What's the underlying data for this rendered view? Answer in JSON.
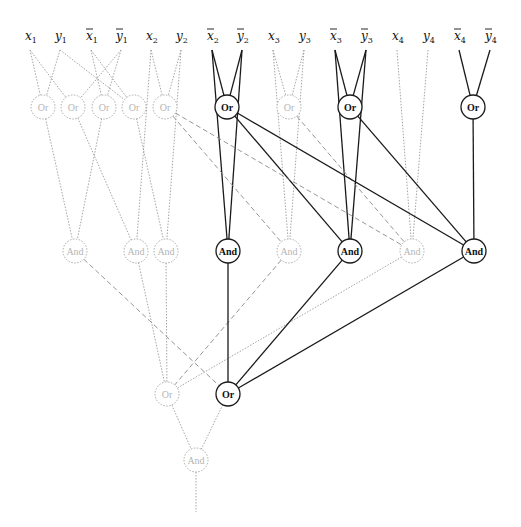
{
  "diagram": {
    "inputs": [
      {
        "id": "x1",
        "base": "x",
        "sub": "1",
        "neg": false,
        "x": 30,
        "active": false
      },
      {
        "id": "y1",
        "base": "y",
        "sub": "1",
        "neg": false,
        "x": 60,
        "active": false
      },
      {
        "id": "nx1",
        "base": "x",
        "sub": "1",
        "neg": true,
        "x": 91,
        "active": false
      },
      {
        "id": "ny1",
        "base": "y",
        "sub": "1",
        "neg": true,
        "x": 121,
        "active": false
      },
      {
        "id": "x2",
        "base": "x",
        "sub": "2",
        "neg": false,
        "x": 151,
        "active": false
      },
      {
        "id": "y2",
        "base": "y",
        "sub": "2",
        "neg": false,
        "x": 181,
        "active": false
      },
      {
        "id": "nx2",
        "base": "x",
        "sub": "2",
        "neg": true,
        "x": 212,
        "active": true
      },
      {
        "id": "ny2",
        "base": "y",
        "sub": "2",
        "neg": true,
        "x": 242,
        "active": true
      },
      {
        "id": "x3",
        "base": "x",
        "sub": "3",
        "neg": false,
        "x": 273,
        "active": false
      },
      {
        "id": "y3",
        "base": "y",
        "sub": "3",
        "neg": false,
        "x": 304,
        "active": false
      },
      {
        "id": "nx3",
        "base": "x",
        "sub": "3",
        "neg": true,
        "x": 335,
        "active": true
      },
      {
        "id": "ny3",
        "base": "y",
        "sub": "3",
        "neg": true,
        "x": 366,
        "active": true
      },
      {
        "id": "x4",
        "base": "x",
        "sub": "4",
        "neg": false,
        "x": 397,
        "active": false
      },
      {
        "id": "y4",
        "base": "y",
        "sub": "4",
        "neg": false,
        "x": 428,
        "active": false
      },
      {
        "id": "nx4",
        "base": "x",
        "sub": "4",
        "neg": true,
        "x": 459,
        "active": true
      },
      {
        "id": "ny4",
        "base": "y",
        "sub": "4",
        "neg": true,
        "x": 490,
        "active": true
      }
    ],
    "input_label_y": 40,
    "input_anchor_y": 50,
    "gates": [
      {
        "id": "or1",
        "label": "Or",
        "x": 43,
        "y": 107,
        "active": false
      },
      {
        "id": "or2",
        "label": "Or",
        "x": 73,
        "y": 107,
        "active": false
      },
      {
        "id": "or3",
        "label": "Or",
        "x": 104,
        "y": 107,
        "active": false
      },
      {
        "id": "or4",
        "label": "Or",
        "x": 134,
        "y": 107,
        "active": false
      },
      {
        "id": "or5",
        "label": "Or",
        "x": 165,
        "y": 107,
        "active": false
      },
      {
        "id": "or6",
        "label": "Or",
        "x": 227,
        "y": 107,
        "active": true
      },
      {
        "id": "or7",
        "label": "Or",
        "x": 289,
        "y": 107,
        "active": false
      },
      {
        "id": "or8",
        "label": "Or",
        "x": 350,
        "y": 107,
        "active": true
      },
      {
        "id": "or9",
        "label": "Or",
        "x": 473,
        "y": 107,
        "active": true
      },
      {
        "id": "and1",
        "label": "And",
        "x": 75,
        "y": 251,
        "active": false
      },
      {
        "id": "and2",
        "label": "And",
        "x": 136,
        "y": 251,
        "active": false
      },
      {
        "id": "and3",
        "label": "And",
        "x": 166,
        "y": 251,
        "active": false
      },
      {
        "id": "and4",
        "label": "And",
        "x": 228,
        "y": 251,
        "active": true
      },
      {
        "id": "and5",
        "label": "And",
        "x": 289,
        "y": 251,
        "active": false
      },
      {
        "id": "and6",
        "label": "And",
        "x": 350,
        "y": 251,
        "active": true
      },
      {
        "id": "and7",
        "label": "And",
        "x": 412,
        "y": 251,
        "active": false
      },
      {
        "id": "and8",
        "label": "And",
        "x": 474,
        "y": 251,
        "active": true
      },
      {
        "id": "orA",
        "label": "Or",
        "x": 167,
        "y": 394,
        "active": false
      },
      {
        "id": "orB",
        "label": "Or",
        "x": 228,
        "y": 394,
        "active": true
      },
      {
        "id": "andF",
        "label": "And",
        "x": 196,
        "y": 460,
        "active": false
      }
    ],
    "gate_radius": 12,
    "edges": [
      {
        "from": "x1",
        "to": "or1",
        "style": "faint"
      },
      {
        "from": "y1",
        "to": "or1",
        "style": "faint"
      },
      {
        "from": "x1",
        "to": "or2",
        "style": "faint"
      },
      {
        "from": "ny1",
        "to": "or2",
        "style": "faint"
      },
      {
        "from": "nx1",
        "to": "or3",
        "style": "faint"
      },
      {
        "from": "ny1",
        "to": "or3",
        "style": "faint"
      },
      {
        "from": "y1",
        "to": "or4",
        "style": "faint"
      },
      {
        "from": "nx1",
        "to": "or4",
        "style": "faint"
      },
      {
        "from": "x2",
        "to": "or5",
        "style": "faint"
      },
      {
        "from": "y2",
        "to": "or5",
        "style": "faint"
      },
      {
        "from": "nx2",
        "to": "or6",
        "style": "solid"
      },
      {
        "from": "ny2",
        "to": "or6",
        "style": "solid"
      },
      {
        "from": "x3",
        "to": "or7",
        "style": "faint"
      },
      {
        "from": "y3",
        "to": "or7",
        "style": "faint"
      },
      {
        "from": "nx3",
        "to": "or8",
        "style": "solid"
      },
      {
        "from": "ny3",
        "to": "or8",
        "style": "solid"
      },
      {
        "from": "nx4",
        "to": "or9",
        "style": "solid"
      },
      {
        "from": "ny4",
        "to": "or9",
        "style": "solid"
      },
      {
        "from": "or1",
        "to": "and1",
        "style": "faint"
      },
      {
        "from": "or3",
        "to": "and1",
        "style": "faint"
      },
      {
        "from": "or2",
        "to": "and2",
        "style": "faint"
      },
      {
        "from": "x2",
        "to": "and2",
        "style": "faint"
      },
      {
        "from": "or4",
        "to": "and3",
        "style": "faint"
      },
      {
        "from": "y2",
        "to": "and3",
        "style": "faint"
      },
      {
        "from": "nx2",
        "to": "and4",
        "style": "solid"
      },
      {
        "from": "ny2",
        "to": "and4",
        "style": "solid"
      },
      {
        "from": "x3",
        "to": "and5",
        "style": "faint"
      },
      {
        "from": "y3",
        "to": "and5",
        "style": "faint"
      },
      {
        "from": "or5",
        "to": "and5",
        "style": "dash"
      },
      {
        "from": "nx3",
        "to": "and6",
        "style": "solid"
      },
      {
        "from": "ny3",
        "to": "and6",
        "style": "solid"
      },
      {
        "from": "or6",
        "to": "and6",
        "style": "solid"
      },
      {
        "from": "x4",
        "to": "and7",
        "style": "faint"
      },
      {
        "from": "y4",
        "to": "and7",
        "style": "faint"
      },
      {
        "from": "or5",
        "to": "and7",
        "style": "dash"
      },
      {
        "from": "or7",
        "to": "and7",
        "style": "dash"
      },
      {
        "from": "or9",
        "to": "and8",
        "style": "solid"
      },
      {
        "from": "or6",
        "to": "and8",
        "style": "solid"
      },
      {
        "from": "or8",
        "to": "and8",
        "style": "solid"
      },
      {
        "from": "and2",
        "to": "orA",
        "style": "faint"
      },
      {
        "from": "and3",
        "to": "orA",
        "style": "faint"
      },
      {
        "from": "and5",
        "to": "orA",
        "style": "dash"
      },
      {
        "from": "and7",
        "to": "orA",
        "style": "faint"
      },
      {
        "from": "and1",
        "to": "orB",
        "style": "dash"
      },
      {
        "from": "and4",
        "to": "orB",
        "style": "solid"
      },
      {
        "from": "and6",
        "to": "orB",
        "style": "solid"
      },
      {
        "from": "and8",
        "to": "orB",
        "style": "solid"
      },
      {
        "from": "orA",
        "to": "andF",
        "style": "faint"
      },
      {
        "from": "orB",
        "to": "andF",
        "style": "faint"
      }
    ],
    "output": {
      "from": "andF",
      "x": 196,
      "y_end": 512,
      "style": "faint"
    }
  }
}
